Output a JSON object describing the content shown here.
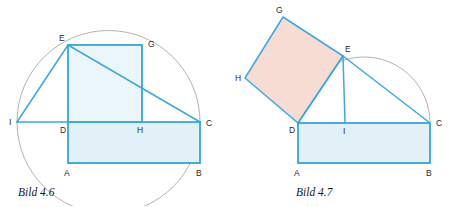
{
  "page": {
    "background": "#ffffff",
    "width": 459,
    "height": 206
  },
  "style": {
    "line_color": "#3aa9dc",
    "arc_color": "#9a8f86",
    "fill_blue": "#e2f1f7",
    "fill_blue_soft": "#eaf6f9",
    "fill_pink": "#f6dcd2",
    "label_color": "#2b2b2b",
    "caption_color": "#1a1a1a"
  },
  "figures": [
    {
      "id": "bild-4-6",
      "caption": "Bild 4.6",
      "caption_pos": {
        "x": 18,
        "y": 196
      },
      "description": "Euclidean construction: square DEGH on segment DC equals rectangle ABCD, with Thales circle through I, E and C.",
      "circle": {
        "cx": 108.5,
        "cy": 122,
        "r": 91.5
      },
      "points": {
        "I": {
          "x": 17,
          "y": 122,
          "label": "I",
          "lx": 9,
          "ly": 125
        },
        "D": {
          "x": 68,
          "y": 122,
          "label": "D",
          "lx": 60,
          "ly": 133
        },
        "A": {
          "x": 68,
          "y": 163,
          "label": "A",
          "lx": 64,
          "ly": 176
        },
        "B": {
          "x": 200,
          "y": 163,
          "label": "B",
          "lx": 196,
          "ly": 176
        },
        "C": {
          "x": 200,
          "y": 122,
          "label": "C",
          "lx": 206,
          "ly": 126
        },
        "H": {
          "x": 142,
          "y": 122,
          "label": "H",
          "lx": 137,
          "ly": 133
        },
        "G": {
          "x": 142,
          "y": 45,
          "label": "G",
          "lx": 148,
          "ly": 47
        },
        "E": {
          "x": 68,
          "y": 45,
          "label": "E",
          "lx": 59,
          "ly": 41
        }
      },
      "square": {
        "name": "DEGH",
        "path": "M68,122 L68,45 L142,45 L142,122 Z",
        "fill": "fill-blue-soft"
      },
      "rectangle": {
        "name": "ABCD",
        "path": "M68,163 L200,163 L200,122 L68,122 Z",
        "fill": "fill-blue"
      },
      "segments": [
        {
          "name": "I-E",
          "d": "M17,122 L68,45"
        },
        {
          "name": "E-C",
          "d": "M68,45 L200,122"
        },
        {
          "name": "I-C",
          "d": "M17,122 L200,122"
        },
        {
          "name": "E-D",
          "d": "M68,45 L68,163"
        },
        {
          "name": "G-H",
          "d": "M142,45 L142,122"
        },
        {
          "name": "E-G",
          "d": "M68,45 L142,45"
        },
        {
          "name": "A-B",
          "d": "M68,163 L200,163"
        },
        {
          "name": "B-C",
          "d": "M200,163 L200,122"
        }
      ]
    },
    {
      "id": "bild-4-7",
      "caption": "Bild 4.7",
      "caption_pos": {
        "x": 296,
        "y": 196
      },
      "description": "Tilted square DEGH on hypotenuse segment DE equals rectangle ABCD, with Thales semicircle over DC and altitude EI.",
      "semicircle": {
        "cx": 364,
        "cy": 123,
        "r": 66,
        "d": "M298,123 A66,66 0 0 1 430,123"
      },
      "points": {
        "G": {
          "x": 283,
          "y": 17,
          "label": "G",
          "lx": 276,
          "ly": 13
        },
        "E": {
          "x": 343,
          "y": 56,
          "label": "E",
          "lx": 345,
          "ly": 52
        },
        "H": {
          "x": 245,
          "y": 78,
          "label": "H",
          "lx": 235,
          "ly": 81
        },
        "D": {
          "x": 298,
          "y": 123,
          "label": "D",
          "lx": 289,
          "ly": 133
        },
        "I": {
          "x": 345,
          "y": 123,
          "label": "I",
          "lx": 343,
          "ly": 134
        },
        "C": {
          "x": 430,
          "y": 123,
          "label": "C",
          "lx": 436,
          "ly": 126
        },
        "A": {
          "x": 298,
          "y": 163,
          "label": "A",
          "lx": 294,
          "ly": 176
        },
        "B": {
          "x": 430,
          "y": 163,
          "label": "B",
          "lx": 426,
          "ly": 176
        }
      },
      "square": {
        "name": "DEGH",
        "path": "M298,123 L343,56 L283,17 L245,78 Z",
        "fill": "fill-pink"
      },
      "rectangle": {
        "name": "ABCD",
        "path": "M298,163 L430,163 L430,123 L298,123 Z",
        "fill": "fill-blue"
      },
      "segments": [
        {
          "name": "D-E",
          "d": "M298,123 L343,56"
        },
        {
          "name": "E-C",
          "d": "M343,56 L430,123"
        },
        {
          "name": "E-I",
          "d": "M343,56 L345,123"
        },
        {
          "name": "D-C",
          "d": "M298,123 L430,123"
        },
        {
          "name": "A-B",
          "d": "M298,163 L430,163"
        },
        {
          "name": "D-A",
          "d": "M298,123 L298,163"
        },
        {
          "name": "B-C",
          "d": "M430,163 L430,123"
        }
      ]
    }
  ]
}
